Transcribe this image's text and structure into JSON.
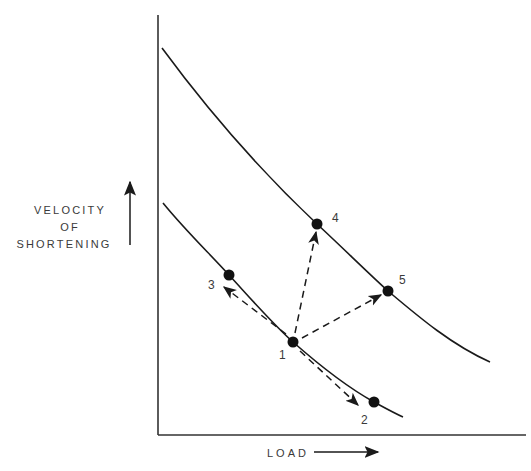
{
  "diagram": {
    "type": "force-velocity relationship schematic",
    "y_axis": {
      "label_lines": [
        "VELOCITY",
        "OF",
        "SHORTENING"
      ],
      "direction_arrow": "up-arrow"
    },
    "x_axis": {
      "label": "LOAD",
      "direction_arrow": "right-arrow"
    },
    "curves": [
      {
        "name": "upper-curve",
        "description": "higher force-velocity curve"
      },
      {
        "name": "lower-curve",
        "description": "baseline force-velocity curve"
      }
    ],
    "points": [
      {
        "id": "1",
        "label": "1",
        "curve": "lower-curve"
      },
      {
        "id": "2",
        "label": "2",
        "curve": "lower-curve"
      },
      {
        "id": "3",
        "label": "3",
        "curve": "lower-curve"
      },
      {
        "id": "4",
        "label": "4",
        "curve": "upper-curve"
      },
      {
        "id": "5",
        "label": "5",
        "curve": "upper-curve"
      }
    ],
    "transitions": [
      {
        "from": "1",
        "to": "2",
        "style": "dashed-arrow"
      },
      {
        "from": "1",
        "to": "3",
        "style": "dashed-arrow"
      },
      {
        "from": "1",
        "to": "4",
        "style": "dashed-arrow"
      },
      {
        "from": "1",
        "to": "5",
        "style": "dashed-arrow"
      }
    ],
    "colors": {
      "line": "#1a1a1a",
      "axis": "#333333",
      "background": "#ffffff"
    }
  }
}
